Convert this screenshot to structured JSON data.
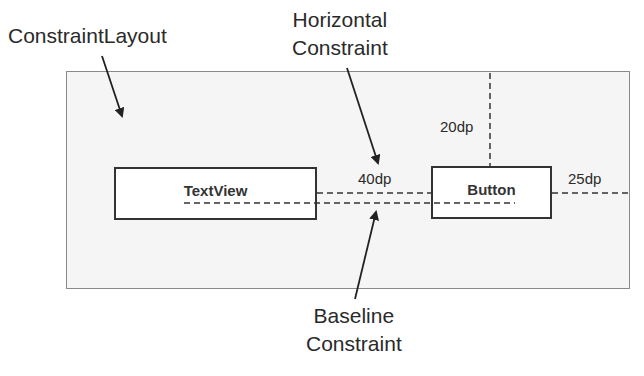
{
  "diagram": {
    "container_label": "ConstraintLayout",
    "horizontal_constraint_label": [
      "Horizontal",
      "Constraint"
    ],
    "baseline_constraint_label": [
      "Baseline",
      "Constraint"
    ],
    "views": {
      "textview": "TextView",
      "button": "Button"
    },
    "margins": {
      "between_views": "40dp",
      "button_top": "20dp",
      "button_right": "25dp"
    }
  }
}
